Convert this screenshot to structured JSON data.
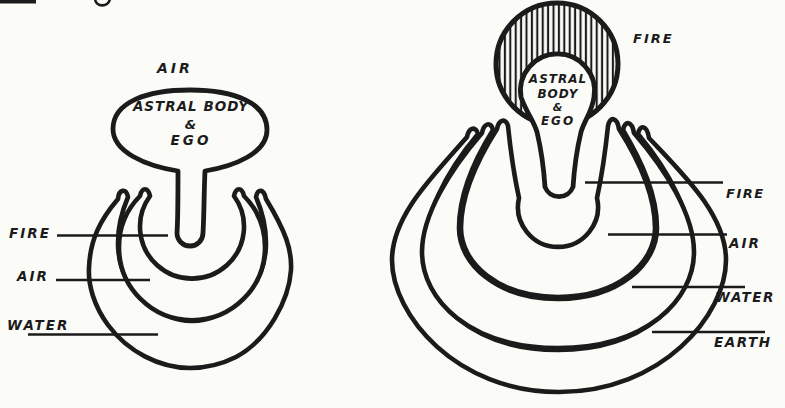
{
  "figure_meta": {
    "description": "Two hand-drawn occult diagrams: a balloon labelled Astral Body & Ego rising from nested element crescents",
    "colors": {
      "ink": "#1b1b1b",
      "paper": "#fbfbf8"
    }
  },
  "left_figure": {
    "title": "AIR",
    "core_lines": [
      "ASTRAL BODY",
      "&",
      "EGO"
    ],
    "labels": {
      "fire": "FIRE",
      "air": "AIR",
      "water": "WATER"
    }
  },
  "right_figure": {
    "title": "FIRE",
    "core_lines": [
      "ASTRAL",
      "BODY",
      "&",
      "EGO"
    ],
    "labels": {
      "fire": "FIRE",
      "air": "AIR",
      "water": "WATER",
      "earth": "EARTH"
    }
  }
}
